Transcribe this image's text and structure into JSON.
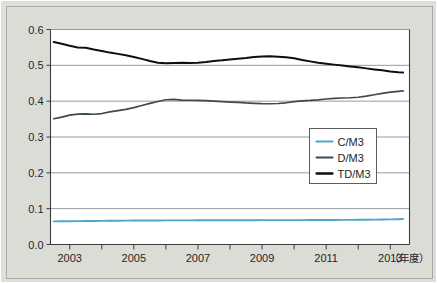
{
  "chart_data": {
    "type": "line",
    "title": "",
    "subtitle": "",
    "xlabel": "（年度）",
    "ylabel": "",
    "xlim": [
      2002.4,
      2013.6
    ],
    "ylim": [
      0.0,
      0.6
    ],
    "grid": true,
    "legend_position": "center-right",
    "x_tick_labels": [
      "2003",
      "2005",
      "2007",
      "2009",
      "2011",
      "2013"
    ],
    "x_tick_values": [
      2003,
      2005,
      2007,
      2009,
      2011,
      2013
    ],
    "x_minor_ticks": [
      2003,
      2004,
      2005,
      2006,
      2007,
      2008,
      2009,
      2010,
      2011,
      2012,
      2013
    ],
    "y_tick_labels": [
      "0.0",
      "0.1",
      "0.2",
      "0.3",
      "0.4",
      "0.5",
      "0.6"
    ],
    "y_tick_values": [
      0.0,
      0.1,
      0.2,
      0.3,
      0.4,
      0.5,
      0.6
    ],
    "x": [
      2002.5,
      2002.75,
      2003.0,
      2003.25,
      2003.5,
      2003.75,
      2004.0,
      2004.25,
      2004.5,
      2004.75,
      2005.0,
      2005.25,
      2005.5,
      2005.75,
      2006.0,
      2006.25,
      2006.5,
      2006.75,
      2007.0,
      2007.25,
      2007.5,
      2007.75,
      2008.0,
      2008.25,
      2008.5,
      2008.75,
      2009.0,
      2009.25,
      2009.5,
      2009.75,
      2010.0,
      2010.25,
      2010.5,
      2010.75,
      2011.0,
      2011.25,
      2011.5,
      2011.75,
      2012.0,
      2012.25,
      2012.5,
      2012.75,
      2013.0,
      2013.25,
      2013.4
    ],
    "series": [
      {
        "name": "C/M3",
        "color": "#4FA3D1",
        "values": [
          0.0645,
          0.0647,
          0.065,
          0.0652,
          0.0655,
          0.0657,
          0.066,
          0.0662,
          0.0664,
          0.0666,
          0.0668,
          0.0669,
          0.067,
          0.0671,
          0.0672,
          0.0673,
          0.0674,
          0.0674,
          0.0675,
          0.0675,
          0.0676,
          0.0676,
          0.0677,
          0.0677,
          0.0678,
          0.0678,
          0.0679,
          0.0679,
          0.068,
          0.068,
          0.0681,
          0.0681,
          0.0682,
          0.0683,
          0.0684,
          0.0685,
          0.0686,
          0.0687,
          0.0689,
          0.0691,
          0.0694,
          0.0697,
          0.0701,
          0.0706,
          0.0712
        ]
      },
      {
        "name": "D/M3",
        "color": "#3C4A54",
        "values": [
          0.351,
          0.3555,
          0.361,
          0.364,
          0.3648,
          0.3635,
          0.3655,
          0.37,
          0.3735,
          0.377,
          0.382,
          0.388,
          0.394,
          0.399,
          0.404,
          0.4052,
          0.403,
          0.4025,
          0.402,
          0.4015,
          0.4,
          0.3985,
          0.3975,
          0.3965,
          0.395,
          0.394,
          0.393,
          0.3928,
          0.3935,
          0.3955,
          0.3985,
          0.401,
          0.402,
          0.4035,
          0.406,
          0.408,
          0.4088,
          0.4095,
          0.411,
          0.414,
          0.418,
          0.4215,
          0.425,
          0.4275,
          0.4285
        ]
      },
      {
        "name": "TD/M3",
        "color": "#0E0E10",
        "values": [
          0.565,
          0.56,
          0.5545,
          0.55,
          0.549,
          0.544,
          0.54,
          0.5355,
          0.532,
          0.528,
          0.5235,
          0.518,
          0.512,
          0.5075,
          0.506,
          0.5065,
          0.507,
          0.5068,
          0.5075,
          0.5095,
          0.512,
          0.514,
          0.5165,
          0.5185,
          0.5205,
          0.523,
          0.5248,
          0.525,
          0.524,
          0.5225,
          0.5195,
          0.515,
          0.511,
          0.5075,
          0.5045,
          0.502,
          0.4995,
          0.497,
          0.4945,
          0.4915,
          0.4885,
          0.486,
          0.483,
          0.481,
          0.4802
        ]
      }
    ]
  },
  "legend": {
    "items": [
      {
        "label": "C/M3"
      },
      {
        "label": "D/M3"
      },
      {
        "label": "TD/M3"
      }
    ]
  },
  "axis": {
    "x_unit_label": "（年度）"
  }
}
